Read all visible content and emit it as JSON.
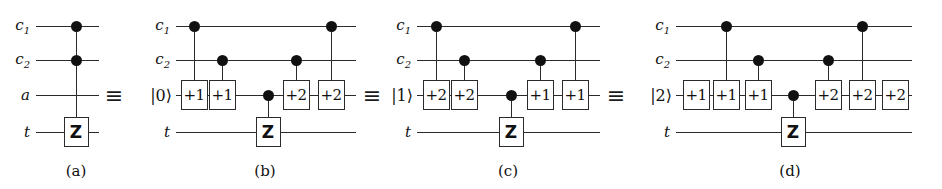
{
  "figure": {
    "width": 942,
    "height": 189,
    "background": "#ffffff",
    "ink_color": "#2b2b2b",
    "equivalence_symbol": "≡",
    "rows": {
      "c1": 26,
      "c2": 60,
      "ancilla": 95,
      "target": 132
    },
    "caption_y": 162
  },
  "panels": [
    {
      "id": "a",
      "caption": "(a)",
      "caption_x": 76,
      "wire_start": 36,
      "wire_end": 99,
      "labels": [
        {
          "name": "c1",
          "text": "c",
          "sub": "1",
          "x": 30,
          "y": 26,
          "ket": false
        },
        {
          "name": "c2",
          "text": "c",
          "sub": "2",
          "x": 30,
          "y": 60,
          "ket": false
        },
        {
          "name": "ancilla",
          "text": "a",
          "sub": "",
          "x": 30,
          "y": 95,
          "ket": false
        },
        {
          "name": "target",
          "text": "t",
          "sub": "",
          "x": 30,
          "y": 132,
          "ket": false
        }
      ],
      "dots": [
        {
          "x": 76,
          "y": 26
        },
        {
          "x": 76,
          "y": 60
        }
      ],
      "links": [
        {
          "x": 76,
          "y1": 26,
          "y2": 132
        }
      ],
      "gates": [
        {
          "kind": "z",
          "label": "Z",
          "x": 76,
          "y": 132
        }
      ],
      "equiv": {
        "x": 114,
        "y": 95
      }
    },
    {
      "id": "b",
      "caption": "(b)",
      "caption_x": 265,
      "wire_start": 176,
      "wire_end": 356,
      "labels": [
        {
          "name": "c1",
          "text": "c",
          "sub": "1",
          "x": 170,
          "y": 26,
          "ket": false
        },
        {
          "name": "c2",
          "text": "c",
          "sub": "2",
          "x": 170,
          "y": 60,
          "ket": false
        },
        {
          "name": "ancilla",
          "text": "|0⟩",
          "sub": "",
          "x": 172,
          "y": 95,
          "ket": true
        },
        {
          "name": "target",
          "text": "t",
          "sub": "",
          "x": 170,
          "y": 132,
          "ket": false
        }
      ],
      "dots": [
        {
          "x": 194,
          "y": 26
        },
        {
          "x": 222,
          "y": 60
        },
        {
          "x": 296,
          "y": 60
        },
        {
          "x": 331,
          "y": 26
        },
        {
          "x": 268,
          "y": 95
        }
      ],
      "links": [
        {
          "x": 194,
          "y1": 26,
          "y2": 95
        },
        {
          "x": 222,
          "y1": 60,
          "y2": 95
        },
        {
          "x": 296,
          "y1": 60,
          "y2": 95
        },
        {
          "x": 331,
          "y1": 26,
          "y2": 95
        },
        {
          "x": 268,
          "y1": 95,
          "y2": 132
        }
      ],
      "gates": [
        {
          "kind": "adder",
          "label": "+1",
          "x": 194,
          "y": 95
        },
        {
          "kind": "adder",
          "label": "+1",
          "x": 222,
          "y": 95
        },
        {
          "kind": "adder",
          "label": "+2",
          "x": 296,
          "y": 95
        },
        {
          "kind": "adder",
          "label": "+2",
          "x": 331,
          "y": 95
        },
        {
          "kind": "z",
          "label": "Z",
          "x": 268,
          "y": 132
        }
      ],
      "equiv": {
        "x": 372,
        "y": 95
      }
    },
    {
      "id": "c",
      "caption": "(c)",
      "caption_x": 508,
      "wire_start": 417,
      "wire_end": 600,
      "labels": [
        {
          "name": "c1",
          "text": "c",
          "sub": "1",
          "x": 411,
          "y": 26,
          "ket": false
        },
        {
          "name": "c2",
          "text": "c",
          "sub": "2",
          "x": 411,
          "y": 60,
          "ket": false
        },
        {
          "name": "ancilla",
          "text": "|1⟩",
          "sub": "",
          "x": 413,
          "y": 95,
          "ket": true
        },
        {
          "name": "target",
          "text": "t",
          "sub": "",
          "x": 411,
          "y": 132,
          "ket": false
        }
      ],
      "dots": [
        {
          "x": 436,
          "y": 26
        },
        {
          "x": 464,
          "y": 60
        },
        {
          "x": 540,
          "y": 60
        },
        {
          "x": 575,
          "y": 26
        },
        {
          "x": 511,
          "y": 95
        }
      ],
      "links": [
        {
          "x": 436,
          "y1": 26,
          "y2": 95
        },
        {
          "x": 464,
          "y1": 60,
          "y2": 95
        },
        {
          "x": 540,
          "y1": 60,
          "y2": 95
        },
        {
          "x": 575,
          "y1": 26,
          "y2": 95
        },
        {
          "x": 511,
          "y1": 95,
          "y2": 132
        }
      ],
      "gates": [
        {
          "kind": "adder",
          "label": "+2",
          "x": 436,
          "y": 95
        },
        {
          "kind": "adder",
          "label": "+2",
          "x": 464,
          "y": 95
        },
        {
          "kind": "adder",
          "label": "+1",
          "x": 540,
          "y": 95
        },
        {
          "kind": "adder",
          "label": "+1",
          "x": 575,
          "y": 95
        },
        {
          "kind": "z",
          "label": "Z",
          "x": 511,
          "y": 132
        }
      ],
      "equiv": {
        "x": 616,
        "y": 95
      }
    },
    {
      "id": "d",
      "caption": "(d)",
      "caption_x": 790,
      "wire_start": 676,
      "wire_end": 912,
      "labels": [
        {
          "name": "c1",
          "text": "c",
          "sub": "1",
          "x": 670,
          "y": 26,
          "ket": false
        },
        {
          "name": "c2",
          "text": "c",
          "sub": "2",
          "x": 670,
          "y": 60,
          "ket": false
        },
        {
          "name": "ancilla",
          "text": "|2⟩",
          "sub": "",
          "x": 672,
          "y": 95,
          "ket": true
        },
        {
          "name": "target",
          "text": "t",
          "sub": "",
          "x": 670,
          "y": 132,
          "ket": false
        }
      ],
      "dots": [
        {
          "x": 726,
          "y": 26
        },
        {
          "x": 758,
          "y": 60
        },
        {
          "x": 828,
          "y": 60
        },
        {
          "x": 862,
          "y": 26
        },
        {
          "x": 793,
          "y": 95
        }
      ],
      "links": [
        {
          "x": 726,
          "y1": 26,
          "y2": 95
        },
        {
          "x": 758,
          "y1": 60,
          "y2": 95
        },
        {
          "x": 828,
          "y1": 60,
          "y2": 95
        },
        {
          "x": 862,
          "y1": 26,
          "y2": 95
        },
        {
          "x": 793,
          "y1": 95,
          "y2": 132
        }
      ],
      "gates": [
        {
          "kind": "adder",
          "label": "+1",
          "x": 696,
          "y": 95
        },
        {
          "kind": "adder",
          "label": "+1",
          "x": 726,
          "y": 95
        },
        {
          "kind": "adder",
          "label": "+1",
          "x": 758,
          "y": 95
        },
        {
          "kind": "adder",
          "label": "+2",
          "x": 828,
          "y": 95
        },
        {
          "kind": "adder",
          "label": "+2",
          "x": 862,
          "y": 95
        },
        {
          "kind": "adder",
          "label": "+2",
          "x": 895,
          "y": 95
        },
        {
          "kind": "z",
          "label": "Z",
          "x": 793,
          "y": 132
        }
      ],
      "equiv": null
    }
  ]
}
